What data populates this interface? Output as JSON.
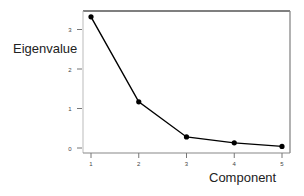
{
  "chart_data": {
    "type": "line",
    "title": "",
    "xlabel": "Component",
    "ylabel": "Eigenvalue",
    "categories": [
      "1",
      "2",
      "3",
      "4",
      "5"
    ],
    "x": [
      1,
      2,
      3,
      4,
      5
    ],
    "values": [
      3.32,
      1.17,
      0.28,
      0.13,
      0.04
    ],
    "series": [
      {
        "name": "Eigenvalue",
        "values": [
          3.32,
          1.17,
          0.28,
          0.13,
          0.04
        ]
      }
    ],
    "xticks": [
      "1",
      "2",
      "3",
      "4",
      "5"
    ],
    "yticks": [
      "0",
      "1",
      "2",
      "3"
    ],
    "xlim": [
      0.85,
      5.17
    ],
    "ylim": [
      -0.1,
      3.5
    ],
    "grid": false,
    "legend": "none",
    "marker": "circle",
    "line_color": "#000000"
  }
}
